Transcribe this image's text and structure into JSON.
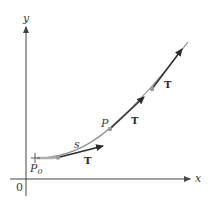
{
  "figure": {
    "axes": {
      "x_label": "x",
      "y_label": "y",
      "origin_label": "0"
    },
    "curve": {
      "description": "increasing, concave-up curve starting at P0"
    },
    "points": {
      "start": {
        "label": "P",
        "subscript": "0"
      },
      "p": {
        "label": "P"
      }
    },
    "arc_length_label": "s",
    "tangent_labels": [
      "T",
      "T",
      "T"
    ],
    "colors": {
      "axis": "#444444",
      "curve": "#8a8a8a",
      "tangent": "#2b2b2b",
      "point": "#9a9a9a",
      "arc_highlight": "#b0b0b0"
    }
  }
}
